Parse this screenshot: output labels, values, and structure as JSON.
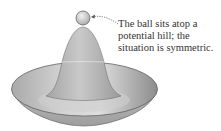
{
  "diagram": {
    "elements": {
      "ball": {
        "label": "ball",
        "shape": "circle"
      },
      "hill": {
        "label": "potential hill"
      },
      "bowl": {
        "label": "potential well (brim)"
      },
      "arrow": {
        "label": "dotted pointer from caption to ball"
      }
    },
    "caption": {
      "lines": [
        "The ball sits atop a",
        "potential hill;  the",
        "situation is symmetric."
      ]
    },
    "colors": {
      "surface_light": "#d9d9d9",
      "surface_mid": "#b5b5b5",
      "surface_dark": "#8f8f8f",
      "outline": "#555555",
      "text": "#333333"
    }
  }
}
